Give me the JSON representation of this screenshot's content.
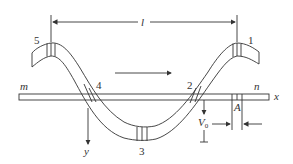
{
  "diagram": {
    "type": "wave-motion-of-rope-on-rod",
    "labels": {
      "wavelength": "l",
      "point1": "1",
      "point2": "2",
      "point3": "3",
      "point4": "4",
      "point5": "5",
      "rod_left": "m",
      "rod_right": "n",
      "x_axis": "x",
      "y_axis": "y",
      "velocity": "V",
      "velocity_sub": "0",
      "section": "A"
    },
    "annotations": {
      "propagation_direction": "right",
      "wavelength_arrow": "between crest 5 and crest 1"
    },
    "colors": {
      "line": "#333333",
      "background": "#ffffff"
    }
  }
}
